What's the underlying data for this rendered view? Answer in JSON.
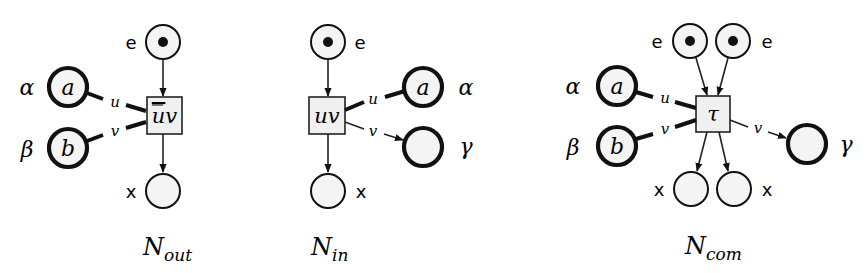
{
  "diagram": {
    "type": "petri-net-figure",
    "nets": [
      {
        "id": "N_out",
        "caption": {
          "base": "N",
          "sub": "out"
        },
        "transition_label": "ūv",
        "places": [
          {
            "id": "e",
            "label": "e",
            "token": true,
            "kind": "control"
          },
          {
            "id": "a",
            "inner": "a",
            "label": "α",
            "kind": "name"
          },
          {
            "id": "b",
            "inner": "b",
            "label": "β",
            "kind": "name"
          },
          {
            "id": "x",
            "label": "x",
            "token": false,
            "kind": "control"
          }
        ],
        "arc_labels": {
          "u": "u",
          "v": "v"
        }
      },
      {
        "id": "N_in",
        "caption": {
          "base": "N",
          "sub": "in"
        },
        "transition_label": "uv",
        "places": [
          {
            "id": "e",
            "label": "e",
            "token": true,
            "kind": "control"
          },
          {
            "id": "a",
            "inner": "a",
            "label": "α",
            "kind": "name"
          },
          {
            "id": "g",
            "inner": "",
            "label": "γ",
            "kind": "name"
          },
          {
            "id": "x",
            "label": "x",
            "token": false,
            "kind": "control"
          }
        ],
        "arc_labels": {
          "u": "u",
          "v": "v"
        }
      },
      {
        "id": "N_com",
        "caption": {
          "base": "N",
          "sub": "com"
        },
        "transition_label": "τ",
        "places": [
          {
            "id": "e1",
            "label": "e",
            "token": true,
            "kind": "control"
          },
          {
            "id": "e2",
            "label": "e",
            "token": true,
            "kind": "control"
          },
          {
            "id": "a",
            "inner": "a",
            "label": "α",
            "kind": "name"
          },
          {
            "id": "b",
            "inner": "b",
            "label": "β",
            "kind": "name"
          },
          {
            "id": "g",
            "inner": "",
            "label": "γ",
            "kind": "name"
          },
          {
            "id": "x1",
            "label": "x",
            "token": false,
            "kind": "control"
          },
          {
            "id": "x2",
            "label": "x",
            "token": false,
            "kind": "control"
          }
        ],
        "arc_labels": {
          "u": "u",
          "v_in": "v",
          "v_out": "v"
        }
      }
    ]
  },
  "labels": {
    "e": "e",
    "x": "x",
    "alpha": "α",
    "beta": "β",
    "gamma": "γ",
    "a": "a",
    "b": "b",
    "u": "u",
    "v": "v",
    "ubar": "u",
    "v_after_ubar": "v",
    "uv": "uv",
    "tau": "τ",
    "N": "N",
    "out": "out",
    "in": "in",
    "com": "com"
  }
}
